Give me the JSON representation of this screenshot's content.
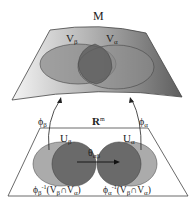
{
  "diagram": {
    "manifold_label": "M",
    "euclidean_label": "R",
    "euclidean_sup": "m",
    "V_beta": {
      "base": "V",
      "sub": "β"
    },
    "V_alpha": {
      "base": "V",
      "sub": "α"
    },
    "U_beta": {
      "base": "U",
      "sub": "β"
    },
    "U_alpha": {
      "base": "U",
      "sub": "α"
    },
    "phi_beta": {
      "base": "ϕ",
      "sub": "β"
    },
    "phi_alpha": {
      "base": "ϕ",
      "sub": "α"
    },
    "theta": {
      "base": "θ",
      "sub": "αβ"
    },
    "preimage_beta": {
      "pre": "ϕ",
      "sub": "β",
      "sup": "-1",
      "rest": "(V",
      "s1": "β",
      "cap": "∩V",
      "s2": "α",
      "close": ")"
    },
    "preimage_alpha": {
      "pre": "ϕ",
      "sub": "α",
      "sup": "-1",
      "rest": "(V",
      "s1": "β",
      "cap": "∩V",
      "s2": "α",
      "close": ")"
    },
    "colors": {
      "surface_light": "#f2f2f2",
      "surface_dark": "#6e6e6e",
      "ellipse_light": "#a8a8a8",
      "ellipse_dark": "#707070",
      "outline": "#333333"
    }
  }
}
